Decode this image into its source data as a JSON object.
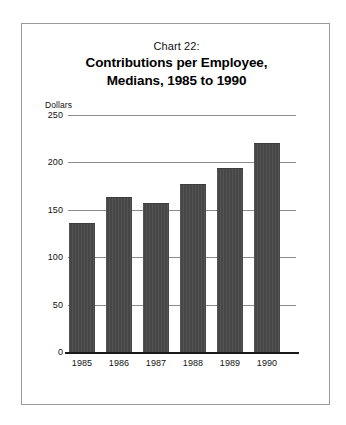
{
  "figure": {
    "background_color": "#ffffff",
    "frame_border_color": "#9a9a9a"
  },
  "title": {
    "line1": "Chart 22:",
    "line2": "Contributions per Employee,",
    "line3": "Medians, 1985 to 1990"
  },
  "axis": {
    "y_unit_label": "Dollars",
    "y_tick_labels": [
      "250",
      "200",
      "150",
      "100",
      "50",
      "0"
    ],
    "x_tick_labels": [
      "1985",
      "1986",
      "1987",
      "1988",
      "1989",
      "1990"
    ]
  },
  "chart_data": {
    "type": "bar",
    "title": "Chart 22: Contributions per Employee, Medians, 1985 to 1990",
    "subtitle": "",
    "categories": [
      "1985",
      "1986",
      "1987",
      "1988",
      "1989",
      "1990"
    ],
    "values": [
      136,
      163,
      157,
      177,
      194,
      220
    ],
    "xlabel": "",
    "ylabel": "Dollars",
    "ylim": [
      0,
      250
    ],
    "yticks": [
      0,
      50,
      100,
      150,
      200,
      250
    ],
    "grid": true,
    "grid_axis": "y",
    "legend": false,
    "legend_position": "none",
    "bar_color": "#4a4a4a",
    "annotations": []
  }
}
